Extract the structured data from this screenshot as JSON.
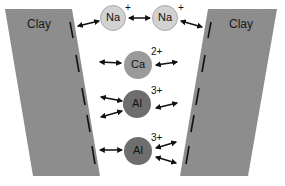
{
  "diagram": {
    "clay_left": {
      "label": "Clay",
      "color": "#8a8a8a"
    },
    "clay_right": {
      "label": "Clay",
      "color": "#8a8a8a"
    },
    "ions": [
      {
        "symbol": "Na",
        "charge": "+",
        "fill": "#d2d2d2"
      },
      {
        "symbol": "Na",
        "charge": "+",
        "fill": "#d2d2d2"
      },
      {
        "symbol": "Ca",
        "charge": "2+",
        "fill": "#9a9a9a"
      },
      {
        "symbol": "Al",
        "charge": "3+",
        "fill": "#6e6e6e"
      },
      {
        "symbol": "Al",
        "charge": "3+",
        "fill": "#6e6e6e"
      }
    ],
    "arrow_color": "#111111"
  }
}
